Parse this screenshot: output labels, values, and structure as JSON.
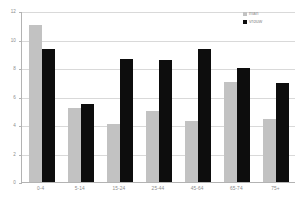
{
  "chart_data": {
    "type": "bar",
    "title": "",
    "subtitle": "",
    "xlabel": "",
    "ylabel": "",
    "categories": [
      "0-4",
      "5-14",
      "15-24",
      "25-44",
      "45-64",
      "65-74",
      "75+"
    ],
    "series": [
      {
        "name": "man",
        "color": "#c2c2c2",
        "values": [
          11.0,
          5.2,
          4.1,
          5.0,
          4.25,
          7.05,
          4.45
        ]
      },
      {
        "name": "vrouw",
        "color": "#0d0d0d",
        "values": [
          9.3,
          5.5,
          8.65,
          8.55,
          9.3,
          8.0,
          6.95
        ]
      }
    ],
    "ylim": [
      0,
      12
    ],
    "ytick_labels": [
      "0",
      "2",
      "4",
      "6",
      "8",
      "10",
      "12"
    ],
    "ytick_values": [
      0,
      2,
      4,
      6,
      8,
      10,
      12
    ],
    "grid": true,
    "legend_position": "top-right",
    "orientation": "vertical",
    "grouping": "grouped"
  },
  "legend": {
    "items": [
      {
        "label": "man",
        "swatch": "legend-swatch-man"
      },
      {
        "label": "vrouw",
        "swatch": "legend-swatch-vrouw"
      }
    ]
  },
  "axes": {
    "y_axis_name": "y-axis",
    "x_axis_name": "x-axis"
  },
  "colors": {
    "series_man": "#c2c2c2",
    "series_vrouw": "#0d0d0d",
    "gridline": "#d9d9d9",
    "axis": "#b3b3b3",
    "tick_text": "#8c8c8c",
    "background": "#ffffff"
  }
}
